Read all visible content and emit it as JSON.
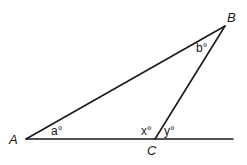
{
  "diagram": {
    "type": "geometry-triangle",
    "points": {
      "A": {
        "label": "A",
        "x": 26,
        "y": 139
      },
      "B": {
        "label": "B",
        "x": 225,
        "y": 26
      },
      "C": {
        "label": "C",
        "x": 155,
        "y": 139
      },
      "line_end": {
        "x": 233,
        "y": 139
      }
    },
    "angles": {
      "a": "a°",
      "b": "b°",
      "x": "x°",
      "y": "y°"
    },
    "colors": {
      "stroke": "#1a1a1a",
      "background": "#ffffff"
    }
  }
}
